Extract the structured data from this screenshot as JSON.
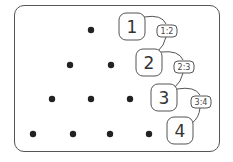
{
  "diagram": {
    "type": "triangular-dot-pattern",
    "rows": [
      {
        "label": "1",
        "dots": 1
      },
      {
        "label": "2",
        "dots": 2
      },
      {
        "label": "3",
        "dots": 3
      },
      {
        "label": "4",
        "dots": 4
      }
    ],
    "ratios": [
      "1:2",
      "2:3",
      "3:4"
    ],
    "colors": {
      "dot": "#222222",
      "stroke": "#555555",
      "text": "#333333",
      "background": "#ffffff"
    }
  }
}
